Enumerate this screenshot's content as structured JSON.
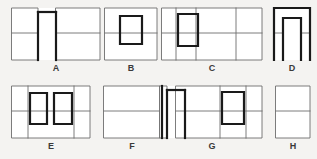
{
  "sheet": {
    "background_color": "#f4f3f1",
    "width": 317,
    "height": 159,
    "thin_line_color": "#6e6e6e",
    "bold_line_color": "#1a1a1a",
    "thin_line_width": 0.9,
    "bold_line_width": 2.2,
    "fill_color": "#ffffff",
    "label_color": "#3a3a3a"
  },
  "figures": [
    {
      "id": "A",
      "label": "A",
      "row": 1,
      "column": 1,
      "description": "Left narrow panel and larger right panel separated by a bold vertical slot open at the bottom",
      "bounds": {
        "x": 12,
        "y": 8,
        "width": 88,
        "height": 52
      },
      "label_position": {
        "x": 49,
        "y": 63
      },
      "thin_paths": [
        "M 12 8 L 38 8 L 38 60 L 12 60 Z",
        "M 12 33 L 38 33",
        "M 56 8 L 100 8 L 100 60 L 56 60 Z",
        "M 56 33 L 100 33"
      ],
      "bold_paths": [
        "M 38 12 L 56 12",
        "M 38 12 L 38 60",
        "M 56 12 L 56 60"
      ]
    },
    {
      "id": "B",
      "label": "B",
      "row": 1,
      "column": 2,
      "description": "Rectangle with horizontal midline and a bold upright inner rectangle centered",
      "bounds": {
        "x": 105,
        "y": 8,
        "width": 52,
        "height": 52
      },
      "label_position": {
        "x": 124,
        "y": 63
      },
      "thin_paths": [
        "M 105 8 L 157 8 L 157 60 L 105 60 Z",
        "M 105 33 L 157 33"
      ],
      "bold_paths": [
        "M 120 16 L 142 16 L 142 44 L 120 44 Z"
      ]
    },
    {
      "id": "C",
      "label": "C",
      "row": 1,
      "column": 3,
      "description": "Wide rectangle with horizontal midline, two vertical dividers, and a bold upright inner rectangle near the left",
      "bounds": {
        "x": 162,
        "y": 8,
        "width": 100,
        "height": 52
      },
      "label_position": {
        "x": 205,
        "y": 63
      },
      "thin_paths": [
        "M 162 8 L 262 8 L 262 60 L 162 60 Z",
        "M 162 33 L 262 33",
        "M 176 8 L 176 60",
        "M 196 8 L 196 60",
        "M 236 8 L 236 60"
      ],
      "bold_paths": [
        "M 178 14 L 198 14 L 198 46 L 178 46 Z"
      ]
    },
    {
      "id": "D",
      "label": "D",
      "row": 1,
      "column": 4,
      "description": "Inverted U arch, bold outline, with thin horizontal midline crossing both legs",
      "bounds": {
        "x": 274,
        "y": 8,
        "width": 36,
        "height": 52
      },
      "label_position": {
        "x": 285,
        "y": 63
      },
      "thin_paths": [
        "M 274 33 L 283 33",
        "M 301 33 L 310 33"
      ],
      "bold_paths": [
        "M 274 60 L 274 8 L 310 8 L 310 60",
        "M 283 60 L 283 18 L 301 18 L 301 60"
      ]
    },
    {
      "id": "E",
      "label": "E",
      "row": 2,
      "column": 1,
      "description": "Wide rectangle with horizontal midline and two bold upright inner rectangles side by side",
      "bounds": {
        "x": 12,
        "y": 86,
        "width": 78,
        "height": 52
      },
      "label_position": {
        "x": 44,
        "y": 141
      },
      "thin_paths": [
        "M 12 86 L 90 86 L 90 138 L 12 138 Z",
        "M 12 111 L 90 111",
        "M 28 86 L 28 138",
        "M 74 86 L 74 138"
      ],
      "bold_paths": [
        "M 30 93 L 47 93 L 47 124 L 30 124 Z",
        "M 54 93 L 72 93 L 72 124 L 54 124 Z"
      ]
    },
    {
      "id": "F",
      "label": "F",
      "row": 2,
      "column": 2,
      "description": "Plain rectangle divided by a single horizontal midline",
      "bounds": {
        "x": 104,
        "y": 86,
        "width": 56,
        "height": 52
      },
      "label_position": {
        "x": 125,
        "y": 141
      },
      "thin_paths": [
        "M 104 86 L 160 86 L 160 138 L 104 138 Z",
        "M 104 111 L 160 111"
      ],
      "bold_paths": []
    },
    {
      "id": "G",
      "label": "G",
      "row": 2,
      "column": 3,
      "description": "Narrow tall sliver at left with a bold hook, wide panel with midline, and a bold upright inner rectangle at the right",
      "bounds": {
        "x": 160,
        "y": 86,
        "width": 102,
        "height": 52
      },
      "label_position": {
        "x": 205,
        "y": 141
      },
      "thin_paths": [
        "M 160 86 L 167 86 L 167 138 L 160 138 Z",
        "M 176 86 L 262 86 L 262 138 L 176 138 Z",
        "M 176 111 L 262 111",
        "M 220 86 L 220 138",
        "M 246 86 L 246 138"
      ],
      "bold_paths": [
        "M 162 86 L 162 138",
        "M 167 90 L 185 90",
        "M 167 90 L 167 138",
        "M 185 90 L 185 138",
        "M 222 92 L 244 92 L 244 124 L 222 124 Z"
      ]
    },
    {
      "id": "H",
      "label": "H",
      "row": 2,
      "column": 4,
      "description": "Narrow upright rectangle divided by a single horizontal midline",
      "bounds": {
        "x": 276,
        "y": 86,
        "width": 34,
        "height": 52
      },
      "label_position": {
        "x": 286,
        "y": 141
      },
      "thin_paths": [
        "M 276 86 L 310 86 L 310 138 L 276 138 Z",
        "M 276 111 L 310 111"
      ],
      "bold_paths": []
    }
  ]
}
